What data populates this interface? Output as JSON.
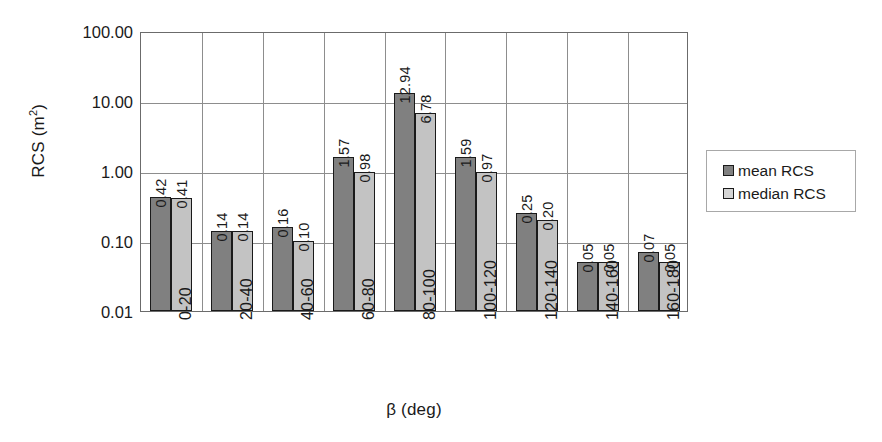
{
  "chart_data": {
    "type": "bar",
    "title": "",
    "xlabel": "β (deg)",
    "ylabel": "RCS (m²)",
    "yscale": "log",
    "ylim": [
      0.01,
      100
    ],
    "ytick_labels": [
      "100.00",
      "10.00",
      "1.00",
      "0.10",
      "0.01"
    ],
    "ytick_values": [
      100,
      10,
      1,
      0.1,
      0.01
    ],
    "grid": true,
    "legend_position": "right",
    "categories": [
      "0-20",
      "20-40",
      "40-60",
      "60-80",
      "80-100",
      "100-120",
      "120-140",
      "140-160",
      "160-180"
    ],
    "series": [
      {
        "name": "mean RCS",
        "color": "#808080",
        "values": [
          0.42,
          0.14,
          0.16,
          1.57,
          12.94,
          1.59,
          0.25,
          0.05,
          0.07
        ],
        "labels": [
          "0.42",
          "0.14",
          "0.16",
          "1.57",
          "12.94",
          "1.59",
          "0.25",
          "0.05",
          "0.07"
        ]
      },
      {
        "name": "median RCS",
        "color": "#c3c3c3",
        "values": [
          0.41,
          0.14,
          0.1,
          0.98,
          6.78,
          0.97,
          0.2,
          0.05,
          0.05
        ],
        "labels": [
          "0.41",
          "0.14",
          "0.10",
          "0.98",
          "6.78",
          "0.97",
          "0.20",
          "0.05",
          "0.05"
        ]
      }
    ]
  },
  "axes": {
    "y_title_main": "RCS (m",
    "y_title_sup": "2",
    "y_title_tail": ")",
    "x_title": "β (deg)"
  },
  "legend": {
    "items": [
      {
        "label": "mean RCS",
        "swatch": "mean"
      },
      {
        "label": "median RCS",
        "swatch": "median"
      }
    ]
  },
  "colors": {
    "mean": "#808080",
    "median": "#c3c3c3",
    "gridline": "#8d8d8d",
    "axis": "#6b6b6b",
    "text": "#1a1a1a"
  }
}
